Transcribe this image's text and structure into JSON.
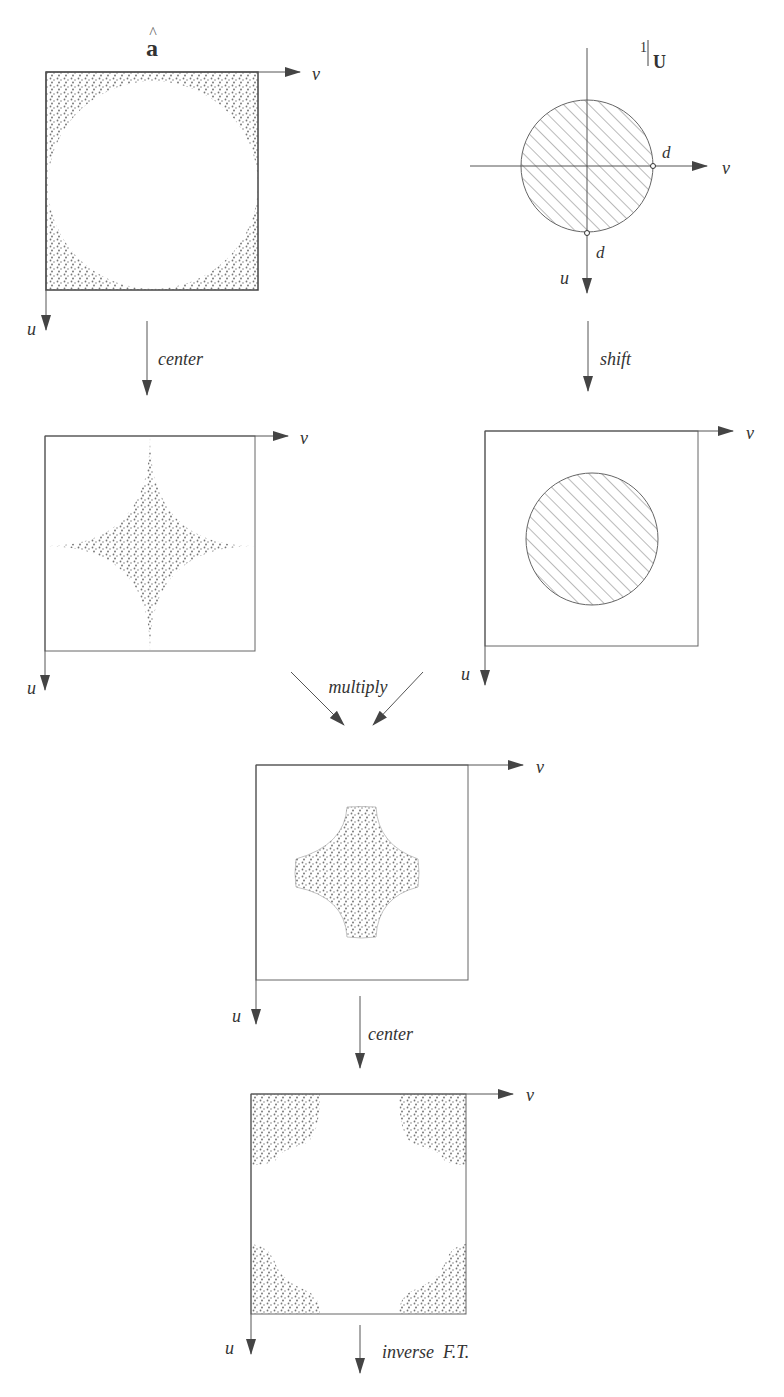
{
  "diagram": {
    "type": "flow",
    "top_left": {
      "title": "a",
      "title_accent": "^",
      "axis_h": "v",
      "axis_v": "u"
    },
    "top_right": {
      "title_num": "1",
      "title_sym": "U",
      "axis_h": "v",
      "axis_v": "u",
      "radius_label_h": "d",
      "radius_label_v": "d"
    },
    "mid_left": {
      "axis_h": "v",
      "axis_v": "u"
    },
    "mid_right": {
      "axis_h": "v",
      "axis_v": "u"
    },
    "center_panel": {
      "axis_h": "v",
      "axis_v": "u"
    },
    "bottom_panel": {
      "axis_h": "v",
      "axis_v": "u"
    },
    "steps": {
      "left_step": "center",
      "right_step": "shift",
      "combine_step": "multiply",
      "recenter_step": "center",
      "final_step": "inverse  F.T."
    }
  },
  "colors": {
    "line": "#555555",
    "stipple": "#6a6a6a",
    "text": "#333333"
  }
}
